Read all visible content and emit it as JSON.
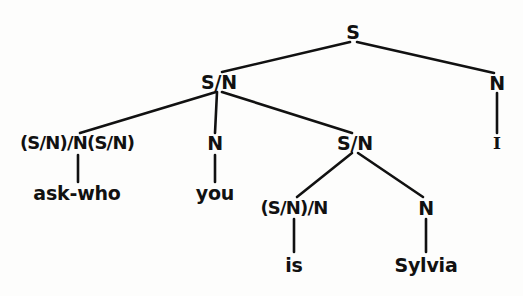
{
  "figure": {
    "type": "syntax-tree",
    "sentence": "ask-who you is Sylvia I",
    "background_color": "#fdfdfc",
    "ink_color": "#111111"
  },
  "nodes": {
    "root": {
      "label": "S",
      "x": 353,
      "y": 32,
      "kind": "category"
    },
    "sn_left": {
      "label": "S/N",
      "x": 219,
      "y": 82,
      "kind": "category"
    },
    "n_right": {
      "label": "N",
      "x": 497,
      "y": 83,
      "kind": "category"
    },
    "i_leaf": {
      "label": "I",
      "x": 497,
      "y": 143,
      "kind": "word"
    },
    "complex_left": {
      "label": "(S/N)/N(S/N)",
      "x": 77,
      "y": 143,
      "kind": "category"
    },
    "askwho_leaf": {
      "label": "ask-who",
      "x": 77,
      "y": 193,
      "kind": "word"
    },
    "n_mid": {
      "label": "N",
      "x": 215,
      "y": 143,
      "kind": "category"
    },
    "you_leaf": {
      "label": "you",
      "x": 215,
      "y": 193,
      "kind": "word"
    },
    "sn_inner": {
      "label": "S/N",
      "x": 355,
      "y": 143,
      "kind": "category"
    },
    "complex_inner": {
      "label": "(S/N)/N",
      "x": 294,
      "y": 208,
      "kind": "category"
    },
    "is_leaf": {
      "label": "is",
      "x": 294,
      "y": 265,
      "kind": "word"
    },
    "n_sylvia": {
      "label": "N",
      "x": 426,
      "y": 208,
      "kind": "category"
    },
    "sylvia_leaf": {
      "label": "Sylvia",
      "x": 426,
      "y": 265,
      "kind": "word"
    }
  },
  "edges": [
    {
      "name": "root-to-sn-left",
      "x1": 350,
      "y1": 42,
      "x2": 222,
      "y2": 72
    },
    {
      "name": "root-to-n-right",
      "x1": 357,
      "y1": 42,
      "x2": 494,
      "y2": 73
    },
    {
      "name": "n-right-to-i",
      "x1": 497,
      "y1": 93,
      "x2": 497,
      "y2": 133
    },
    {
      "name": "sn-left-to-complex-left",
      "x1": 216,
      "y1": 92,
      "x2": 80,
      "y2": 133
    },
    {
      "name": "sn-left-to-n-mid",
      "x1": 217,
      "y1": 92,
      "x2": 215,
      "y2": 133
    },
    {
      "name": "sn-left-to-sn-inner",
      "x1": 222,
      "y1": 92,
      "x2": 352,
      "y2": 133
    },
    {
      "name": "complex-left-to-askwho",
      "x1": 78,
      "y1": 155,
      "x2": 78,
      "y2": 182
    },
    {
      "name": "n-mid-to-you",
      "x1": 215,
      "y1": 155,
      "x2": 215,
      "y2": 182
    },
    {
      "name": "sn-inner-to-complex-inner",
      "x1": 352,
      "y1": 153,
      "x2": 297,
      "y2": 197
    },
    {
      "name": "sn-inner-to-n-sylvia",
      "x1": 358,
      "y1": 153,
      "x2": 423,
      "y2": 197
    },
    {
      "name": "complex-inner-to-is",
      "x1": 294,
      "y1": 219,
      "x2": 294,
      "y2": 252
    },
    {
      "name": "n-sylvia-to-sylvia",
      "x1": 426,
      "y1": 219,
      "x2": 426,
      "y2": 252
    }
  ]
}
